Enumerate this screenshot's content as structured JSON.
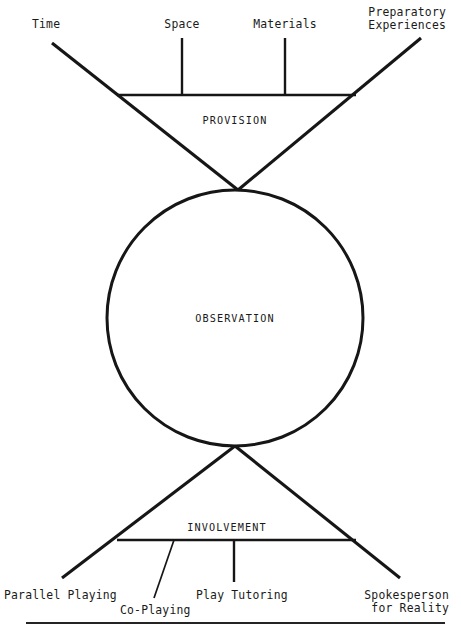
{
  "figure": {
    "title_visible": false,
    "background_color": "#ffffff",
    "ink_color": "#161616",
    "regions": [
      {
        "id": "provision",
        "label": "PROVISION"
      },
      {
        "id": "observation",
        "label": "OBSERVATION"
      },
      {
        "id": "involvement",
        "label": "INVOLVEMENT"
      }
    ],
    "top_nodes": [
      {
        "id": "time",
        "label": "Time"
      },
      {
        "id": "space",
        "label": "Space"
      },
      {
        "id": "materials",
        "label": "Materials"
      },
      {
        "id": "preparatory-experiences",
        "label": "Preparatory\nExperiences"
      }
    ],
    "bottom_nodes": [
      {
        "id": "parallel-playing",
        "label": "Parallel Playing"
      },
      {
        "id": "co-playing",
        "label": "Co-Playing"
      },
      {
        "id": "play-tutoring",
        "label": "Play Tutoring"
      },
      {
        "id": "spokesperson-for-reality",
        "label": "Spokesperson\nfor Reality"
      }
    ]
  }
}
